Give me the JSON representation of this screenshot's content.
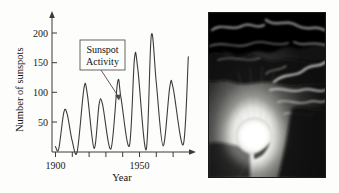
{
  "figure": {
    "background_color": "#fdfdfb"
  },
  "chart_data": {
    "type": "line",
    "title": "",
    "subtitle": "",
    "xlabel": "Year",
    "ylabel": "Number of sunspots",
    "xlim": [
      1898,
      1980
    ],
    "ylim": [
      0,
      215
    ],
    "grid": false,
    "legend": "none",
    "line_color": "#3c3c3c",
    "xticks": [
      1900,
      1910,
      1920,
      1930,
      1940,
      1950,
      1960,
      1970
    ],
    "xtick_labels": [
      "1900",
      "",
      "",
      "",
      "",
      "1950",
      "",
      ""
    ],
    "xtick_labels_shown": [
      "1900",
      "1950"
    ],
    "yticks": [
      50,
      100,
      150,
      200
    ],
    "ytick_labels": [
      "50",
      "100",
      "150",
      "200"
    ],
    "x": [
      1900,
      1902,
      1905,
      1907,
      1910,
      1913,
      1917,
      1919,
      1923,
      1926,
      1928,
      1933,
      1937,
      1939,
      1944,
      1947,
      1949,
      1954,
      1957,
      1960,
      1964,
      1968,
      1970,
      1976,
      1979
    ],
    "values": [
      9,
      5,
      64,
      62,
      18,
      1,
      104,
      94,
      6,
      78,
      78,
      5,
      114,
      88,
      10,
      152,
      135,
      4,
      190,
      112,
      10,
      106,
      104,
      12,
      155
    ],
    "series": [
      {
        "name": "Sunspot number",
        "x": [
          1900,
          1902,
          1905,
          1907,
          1910,
          1913,
          1917,
          1919,
          1923,
          1926,
          1928,
          1933,
          1937,
          1939,
          1944,
          1947,
          1949,
          1954,
          1957,
          1960,
          1964,
          1968,
          1970,
          1976,
          1979
        ],
        "values": [
          9,
          5,
          64,
          62,
          18,
          1,
          104,
          94,
          6,
          78,
          78,
          5,
          114,
          88,
          10,
          152,
          135,
          4,
          190,
          112,
          10,
          106,
          104,
          12,
          155
        ]
      }
    ],
    "annotations": [
      {
        "name": "sunspot-activity-callout",
        "line1": "Sunspot",
        "line2": "Activity",
        "text": "Sunspot Activity",
        "points_to_x": 1937,
        "points_to_y": 114
      }
    ]
  },
  "photo": {
    "name": "sun-behind-clouds-photo",
    "alt": "Bright sun partially obscured by dark clouds",
    "background_color": "#060606",
    "sun_color": "#ffffff"
  }
}
